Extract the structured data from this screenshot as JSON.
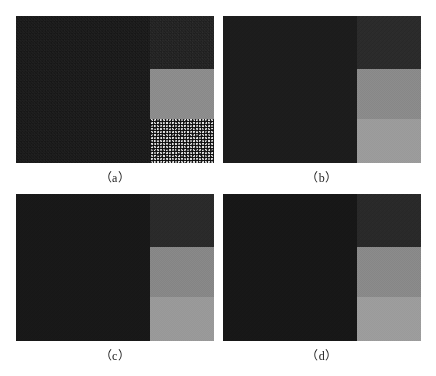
{
  "figure": {
    "background_color": "#ffffff",
    "width": 436,
    "height": 376,
    "panels": [
      {
        "id": "a",
        "caption": "（a）",
        "x": 16,
        "y": 16,
        "w": 198,
        "h": 147,
        "description": "noisy image with salt-and-pepper corruption in lower-right band",
        "left_color": "#1d1d1d",
        "bands": [
          {
            "name": "band-top",
            "color": "#262626",
            "noise": "noise-fine"
          },
          {
            "name": "band-mid",
            "color": "#8c8c8c",
            "noise": "noise-grain"
          },
          {
            "name": "band-bottom",
            "color": "#9a9a9a",
            "noise": "noise-salt"
          }
        ],
        "left_noise": "noise-fine"
      },
      {
        "id": "b",
        "caption": "（b）",
        "x": 223,
        "y": 16,
        "w": 198,
        "h": 147,
        "description": "restored image, smooth bands",
        "left_color": "#1c1c1c",
        "bands": [
          {
            "name": "band-top",
            "color": "#2b2b2b",
            "noise": "noise-soft"
          },
          {
            "name": "band-mid",
            "color": "#8a8a8a",
            "noise": "noise-grain"
          },
          {
            "name": "band-bottom",
            "color": "#9b9b9b",
            "noise": "noise-grain"
          }
        ],
        "left_noise": "noise-soft"
      },
      {
        "id": "c",
        "caption": "（c）",
        "x": 16,
        "y": 194,
        "w": 198,
        "h": 147,
        "description": "restored image variant c",
        "left_color": "#181818",
        "bands": [
          {
            "name": "band-top",
            "color": "#2a2a2a",
            "noise": "noise-soft"
          },
          {
            "name": "band-mid",
            "color": "#878787",
            "noise": "noise-grain"
          },
          {
            "name": "band-bottom",
            "color": "#999999",
            "noise": "noise-grain"
          }
        ],
        "left_noise": "noise-soft"
      },
      {
        "id": "d",
        "caption": "（d）",
        "x": 223,
        "y": 194,
        "w": 198,
        "h": 147,
        "description": "restored image variant d",
        "left_color": "#171717",
        "bands": [
          {
            "name": "band-top",
            "color": "#292929",
            "noise": "noise-soft"
          },
          {
            "name": "band-mid",
            "color": "#898989",
            "noise": "noise-grain"
          },
          {
            "name": "band-bottom",
            "color": "#9c9c9c",
            "noise": "noise-grain"
          }
        ],
        "left_noise": "noise-soft"
      }
    ]
  }
}
